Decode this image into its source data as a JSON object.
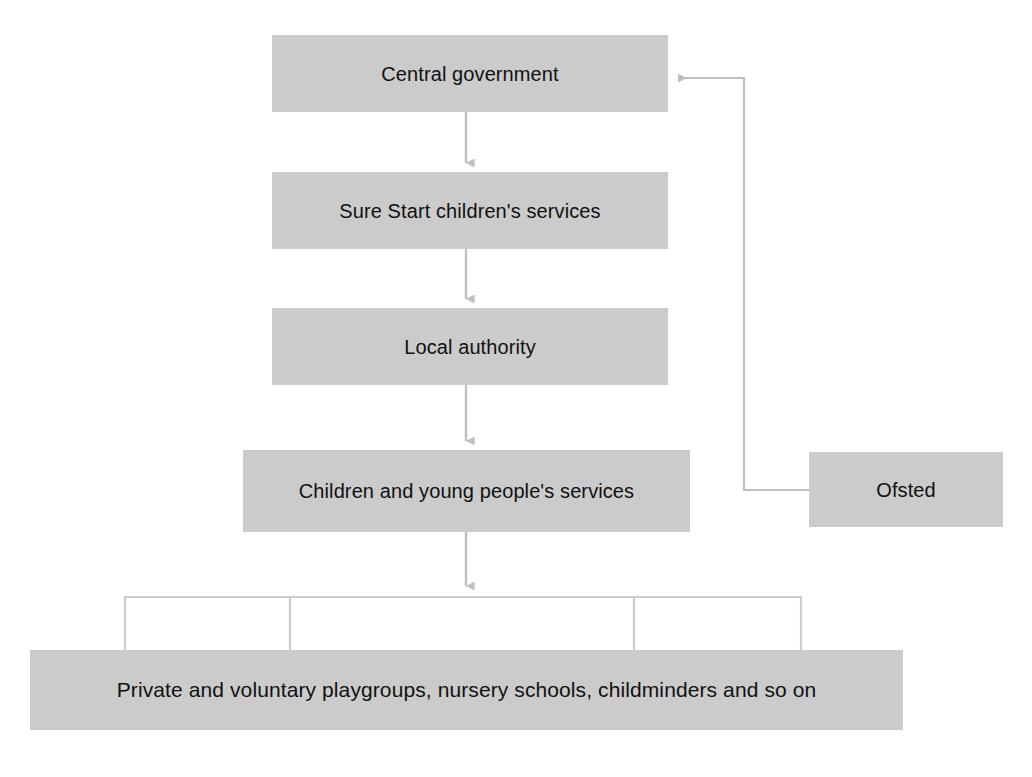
{
  "diagram": {
    "type": "flowchart",
    "background_color": "#ffffff",
    "box_fill_color": "#cbcbcb",
    "connector_color": "#bfbfbf",
    "text_color": "#111111",
    "nodes": [
      {
        "id": "central-government",
        "label": "Central government",
        "x": 272,
        "y": 35,
        "width": 396,
        "height": 77
      },
      {
        "id": "sure-start",
        "label": "Sure Start children's services",
        "x": 272,
        "y": 172,
        "width": 396,
        "height": 77
      },
      {
        "id": "local-authority",
        "label": "Local authority",
        "x": 272,
        "y": 308,
        "width": 396,
        "height": 77
      },
      {
        "id": "children-young-people",
        "label": "Children and young people's services",
        "x": 243,
        "y": 450,
        "width": 447,
        "height": 82
      },
      {
        "id": "ofsted",
        "label": "Ofsted",
        "x": 809,
        "y": 452,
        "width": 194,
        "height": 75
      },
      {
        "id": "providers",
        "label": "Private and voluntary playgroups, nursery schools, childminders and so on",
        "x": 30,
        "y": 650,
        "width": 873,
        "height": 80
      }
    ],
    "connectors": [
      {
        "id": "central-to-surestart",
        "from": "central-government",
        "to": "sure-start",
        "style": "arrow-down"
      },
      {
        "id": "surestart-to-localauthority",
        "from": "sure-start",
        "to": "local-authority",
        "style": "arrow-down"
      },
      {
        "id": "localauthority-to-children",
        "from": "local-authority",
        "to": "children-young-people",
        "style": "arrow-down"
      },
      {
        "id": "children-to-providers",
        "from": "children-young-people",
        "to": "providers",
        "style": "arrow-down-bracket"
      },
      {
        "id": "ofsted-to-central",
        "from": "ofsted",
        "to": "central-government",
        "style": "elbow-arrow-left"
      }
    ]
  }
}
